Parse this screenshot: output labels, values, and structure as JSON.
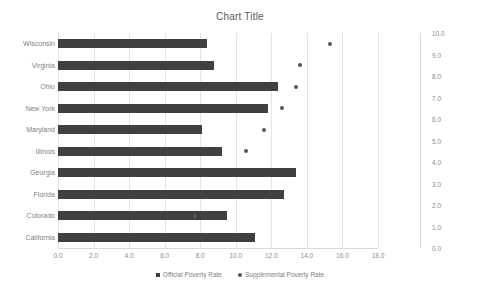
{
  "chart_data": {
    "type": "bar",
    "title": "Chart Title",
    "xlabel": "",
    "ylabel": "",
    "grid": true,
    "legend_position": "bottom",
    "orientation": "horizontal",
    "categories": [
      "Wisconsin",
      "Virginia",
      "Ohio",
      "New York",
      "Maryland",
      "Illinois",
      "Georgia",
      "Florida",
      "Colorado",
      "California"
    ],
    "series": [
      {
        "name": "Official Poverty Rate",
        "type": "bar",
        "axis": "primary",
        "marker": "square",
        "color": "#404040",
        "values": [
          8.4,
          8.8,
          12.4,
          11.8,
          8.1,
          9.2,
          13.4,
          12.7,
          9.5,
          11.1
        ]
      },
      {
        "name": "Supplemental Poverty Rate",
        "type": "scatter",
        "axis": "secondary",
        "marker": "circle",
        "color": "#555555",
        "values": [
          9.3,
          7.6,
          7.4,
          6.6,
          5.6,
          4.6,
          null,
          null,
          1.7,
          null
        ]
      }
    ],
    "xlim": [
      0,
      18
    ],
    "xticks": [
      "0.0",
      "2.0",
      "4.0",
      "6.0",
      "8.0",
      "10.0",
      "12.0",
      "14.0",
      "16.0",
      "18.0"
    ],
    "ylim_secondary": [
      0,
      10
    ],
    "y2ticks": [
      "10.0",
      "9.0",
      "8.0",
      "7.0",
      "6.0",
      "5.0",
      "4.0",
      "3.0",
      "2.0",
      "1.0",
      "0.0"
    ]
  },
  "legend": {
    "items": [
      {
        "label": "Official Poverty Rate",
        "marker": "square"
      },
      {
        "label": "Supplemental Poverty Rate",
        "marker": "circle"
      }
    ]
  },
  "colors": {
    "bar": "#404040",
    "dot": "#555555",
    "grid": "#e4e4e4",
    "text": "#7f7f7f",
    "title": "#595959",
    "background": "#ffffff"
  }
}
